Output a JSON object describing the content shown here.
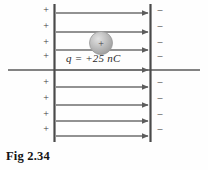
{
  "figure": {
    "caption": "Fig 2.34",
    "charge_label": "q = +25 nC",
    "sphere_sign": "+",
    "plate_positive_sign": "+",
    "plate_negative_sign": "–",
    "colors": {
      "background": "#fefefe",
      "plate_line": "#4a4a4a",
      "field_line": "#6e6e6e",
      "axis_line": "#5a5a5a",
      "sphere_fill": "#b9b9b9",
      "sphere_edge": "#9a9a9a",
      "text": "#2b2b2b",
      "caption_text": "#141414"
    }
  },
  "diagram_data": {
    "type": "field-diagram",
    "description": "Uniform electric field between two parallel charged plates with a positive point charge placed in the field",
    "left_plate": {
      "name": "positive-plate",
      "x": 54,
      "y_top": 4,
      "y_bottom": 142,
      "charge_sign": "+",
      "charge_positions_y": [
        10,
        26,
        42,
        56,
        82,
        98,
        114,
        129
      ]
    },
    "right_plate": {
      "name": "negative-plate",
      "x": 150,
      "y_top": 4,
      "y_bottom": 142,
      "charge_sign": "–",
      "charge_positions_y": [
        10,
        26,
        42,
        56,
        82,
        98,
        114,
        129
      ]
    },
    "field_lines": {
      "direction": "left-to-right",
      "x_start": 56,
      "x_end": 150,
      "y_positions": [
        13,
        32,
        50,
        70,
        87,
        105,
        121,
        136
      ]
    },
    "axis_line": {
      "name": "horizontal-axis",
      "y": 70,
      "x_start": 8,
      "x_end": 200
    },
    "point_charge": {
      "label": "q = +25 nC",
      "value": 25,
      "unit": "nC",
      "sign": "+",
      "center_x": 101,
      "center_y": 43,
      "radius": 11
    }
  }
}
